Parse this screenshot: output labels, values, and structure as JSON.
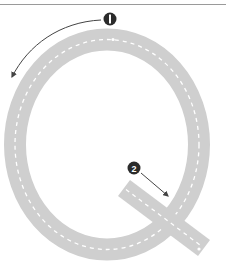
{
  "diagram": {
    "colors": {
      "road": "#cfcfcf",
      "centerline": "#ffffff",
      "marker": "#2b2b2b",
      "arrow": "#444444",
      "top_rule": "#9a9a9a"
    },
    "markers": [
      {
        "label": "1",
        "direction": "counter-clockwise along top of Q"
      },
      {
        "label": "2",
        "direction": "down-right along tail of Q"
      }
    ]
  }
}
